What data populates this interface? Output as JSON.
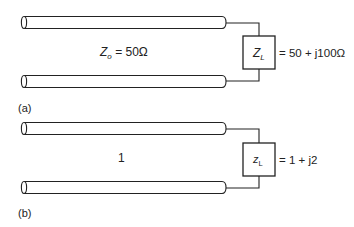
{
  "panels": [
    {
      "id": "a",
      "caption": "(a)",
      "line_label_main": "Z",
      "line_label_sub": "o",
      "line_label_rest": " = 50Ω",
      "load_label_main": "Z",
      "load_label_sub": "L",
      "load_value": "= 50 + j100Ω"
    },
    {
      "id": "b",
      "caption": "(b)",
      "line_label_main": "1",
      "line_label_sub": "",
      "line_label_rest": "",
      "load_label_main": "z",
      "load_label_sub": "L",
      "load_value": "= 1 + j2"
    }
  ],
  "colors": {
    "stroke": "#222222",
    "background": "#ffffff"
  }
}
